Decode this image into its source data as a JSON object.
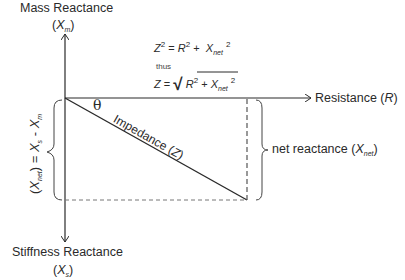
{
  "diagram": {
    "title_top": {
      "text": "Mass Reactance",
      "symbol": "X",
      "subscript": "m"
    },
    "title_bottom": {
      "text": "Stiffness Reactance",
      "symbol": "X",
      "subscript": "s"
    },
    "x_axis": {
      "label": "Resistance",
      "symbol": "R"
    },
    "angle_label": "θ",
    "hypotenuse_label": {
      "text": "Impedance",
      "symbol": "Z"
    },
    "right_brace_label": {
      "text": "net reactance",
      "symbol": "X",
      "subscript": "net"
    },
    "left_brace_label": {
      "lhs_symbol": "X",
      "lhs_subscript": "net",
      "equals": "=",
      "rhs1_symbol": "X",
      "rhs1_subscript": "s",
      "minus": "-",
      "rhs2_symbol": "X",
      "rhs2_subscript": "m"
    },
    "equations": {
      "line1": {
        "lhs": "Z",
        "lhs_exp": "2",
        "eq": "=",
        "t1": "R",
        "t1_exp": "2",
        "plus": "+",
        "t2": "X",
        "t2_sub": "net",
        "t2_exp": "2"
      },
      "connector": "thus",
      "line2": {
        "lhs": "Z",
        "eq": "=",
        "radical": "√",
        "t1": "R",
        "t1_exp": "2",
        "plus": "+",
        "t2": "X",
        "t2_sub": "net",
        "t2_exp": "2"
      }
    },
    "colors": {
      "line": "#2a2a2a",
      "dashed": "#555555",
      "background": "#ffffff"
    }
  }
}
